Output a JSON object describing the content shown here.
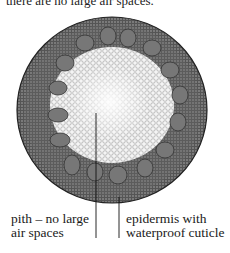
{
  "header": {
    "clipped_text": "there are no large air spaces."
  },
  "diagram": {
    "labels": [
      {
        "id": "pith",
        "line1": "pith – no large",
        "line2": "air spaces"
      },
      {
        "id": "epidermis",
        "line1": "epidermis with",
        "line2": "waterproof cuticle"
      }
    ]
  }
}
